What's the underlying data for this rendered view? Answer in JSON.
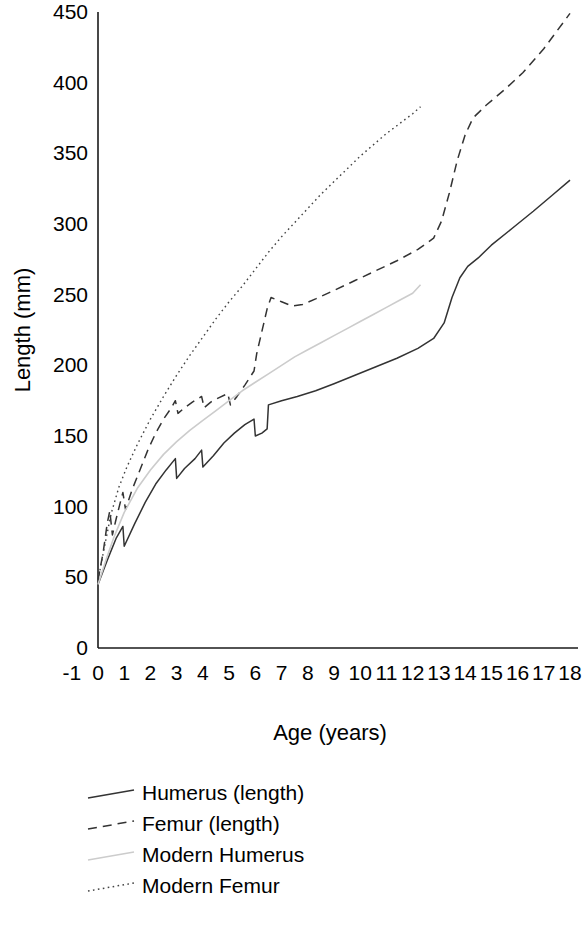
{
  "chart_data": {
    "type": "line",
    "title": "",
    "xlabel": "Age (years)",
    "ylabel": "Length (mm)",
    "xlim": [
      -1,
      18
    ],
    "ylim": [
      0,
      450
    ],
    "xticks": [
      "-1",
      "0",
      "1",
      "2",
      "3",
      "4",
      "5",
      "6",
      "7",
      "8",
      "9",
      "10",
      "11",
      "12",
      "13",
      "14",
      "15",
      "16",
      "17",
      "18"
    ],
    "yticks": [
      "0",
      "50",
      "100",
      "150",
      "200",
      "250",
      "300",
      "350",
      "400",
      "450"
    ],
    "grid": false,
    "legend_position": "below-plot-left",
    "series": [
      {
        "name": "Humerus (length)",
        "style": "solid",
        "color": "#333333",
        "width": 1.5,
        "points": [
          [
            0.0,
            45
          ],
          [
            0.35,
            62
          ],
          [
            0.7,
            78
          ],
          [
            0.95,
            86
          ],
          [
            1.0,
            72
          ],
          [
            1.4,
            88
          ],
          [
            1.8,
            103
          ],
          [
            2.2,
            116
          ],
          [
            2.6,
            126
          ],
          [
            2.95,
            134
          ],
          [
            3.0,
            120
          ],
          [
            3.3,
            127
          ],
          [
            3.7,
            134
          ],
          [
            3.95,
            140
          ],
          [
            4.0,
            128
          ],
          [
            4.4,
            136
          ],
          [
            4.8,
            145
          ],
          [
            5.2,
            152
          ],
          [
            5.6,
            158
          ],
          [
            5.95,
            162
          ],
          [
            6.0,
            150
          ],
          [
            6.25,
            152
          ],
          [
            6.45,
            155
          ],
          [
            6.5,
            172
          ],
          [
            7.0,
            175
          ],
          [
            7.6,
            178
          ],
          [
            8.3,
            182
          ],
          [
            9.0,
            187
          ],
          [
            9.8,
            193
          ],
          [
            10.6,
            199
          ],
          [
            11.4,
            205
          ],
          [
            12.2,
            212
          ],
          [
            12.8,
            219
          ],
          [
            13.2,
            230
          ],
          [
            13.5,
            248
          ],
          [
            13.8,
            262
          ],
          [
            14.1,
            270
          ],
          [
            14.5,
            276
          ],
          [
            15.0,
            285
          ],
          [
            15.8,
            297
          ],
          [
            16.6,
            309
          ],
          [
            17.3,
            320
          ],
          [
            18.0,
            331
          ]
        ]
      },
      {
        "name": "Femur (length)",
        "style": "dashed",
        "color": "#333333",
        "width": 1.5,
        "points": [
          [
            0.0,
            48
          ],
          [
            0.2,
            68
          ],
          [
            0.35,
            88
          ],
          [
            0.45,
            97
          ],
          [
            0.55,
            80
          ],
          [
            0.7,
            92
          ],
          [
            0.85,
            103
          ],
          [
            0.95,
            110
          ],
          [
            1.05,
            98
          ],
          [
            1.3,
            112
          ],
          [
            1.6,
            126
          ],
          [
            1.9,
            140
          ],
          [
            2.2,
            152
          ],
          [
            2.5,
            162
          ],
          [
            2.8,
            170
          ],
          [
            2.95,
            175
          ],
          [
            3.05,
            166
          ],
          [
            3.3,
            170
          ],
          [
            3.6,
            174
          ],
          [
            3.95,
            178
          ],
          [
            4.05,
            170
          ],
          [
            4.3,
            174
          ],
          [
            4.6,
            177
          ],
          [
            4.95,
            180
          ],
          [
            5.05,
            172
          ],
          [
            5.3,
            178
          ],
          [
            5.6,
            186
          ],
          [
            5.95,
            196
          ],
          [
            6.05,
            208
          ],
          [
            6.25,
            224
          ],
          [
            6.45,
            240
          ],
          [
            6.6,
            248
          ],
          [
            7.0,
            245
          ],
          [
            7.4,
            242
          ],
          [
            7.8,
            243
          ],
          [
            8.3,
            247
          ],
          [
            9.0,
            253
          ],
          [
            9.8,
            260
          ],
          [
            10.6,
            267
          ],
          [
            11.4,
            274
          ],
          [
            12.2,
            282
          ],
          [
            12.8,
            290
          ],
          [
            13.1,
            302
          ],
          [
            13.4,
            322
          ],
          [
            13.7,
            345
          ],
          [
            14.0,
            363
          ],
          [
            14.3,
            375
          ],
          [
            14.8,
            384
          ],
          [
            15.5,
            395
          ],
          [
            16.2,
            407
          ],
          [
            17.0,
            424
          ],
          [
            18.0,
            449
          ]
        ]
      },
      {
        "name": "Modern Humerus",
        "style": "solid",
        "color": "#cccccc",
        "width": 1.6,
        "points": [
          [
            0.0,
            45
          ],
          [
            0.3,
            62
          ],
          [
            0.6,
            78
          ],
          [
            1.0,
            96
          ],
          [
            1.5,
            113
          ],
          [
            2.0,
            126
          ],
          [
            2.5,
            137
          ],
          [
            3.0,
            146
          ],
          [
            3.5,
            154
          ],
          [
            4.0,
            161
          ],
          [
            4.5,
            168
          ],
          [
            5.0,
            175
          ],
          [
            5.5,
            182
          ],
          [
            6.0,
            188
          ],
          [
            6.5,
            194
          ],
          [
            7.0,
            200
          ],
          [
            7.5,
            206
          ],
          [
            8.0,
            211
          ],
          [
            8.5,
            216
          ],
          [
            9.0,
            221
          ],
          [
            9.5,
            226
          ],
          [
            10.0,
            231
          ],
          [
            10.5,
            236
          ],
          [
            11.0,
            241
          ],
          [
            11.5,
            246
          ],
          [
            12.0,
            251
          ],
          [
            12.3,
            257
          ]
        ]
      },
      {
        "name": "Modern Femur",
        "style": "dotted",
        "color": "#444444",
        "width": 1.4,
        "points": [
          [
            0.0,
            48
          ],
          [
            0.25,
            72
          ],
          [
            0.5,
            95
          ],
          [
            0.8,
            114
          ],
          [
            1.1,
            128
          ],
          [
            1.5,
            144
          ],
          [
            2.0,
            162
          ],
          [
            2.5,
            178
          ],
          [
            3.0,
            193
          ],
          [
            3.5,
            207
          ],
          [
            4.0,
            220
          ],
          [
            4.5,
            233
          ],
          [
            5.0,
            245
          ],
          [
            5.5,
            256
          ],
          [
            6.0,
            268
          ],
          [
            6.5,
            280
          ],
          [
            7.0,
            291
          ],
          [
            7.5,
            301
          ],
          [
            8.0,
            311
          ],
          [
            8.5,
            321
          ],
          [
            9.0,
            330
          ],
          [
            9.5,
            339
          ],
          [
            10.0,
            348
          ],
          [
            10.5,
            356
          ],
          [
            11.0,
            364
          ],
          [
            11.5,
            371
          ],
          [
            12.0,
            378
          ],
          [
            12.3,
            383
          ]
        ]
      }
    ]
  },
  "legend": {
    "items": [
      {
        "label": "Humerus (length)",
        "style": "solid",
        "color": "#333333"
      },
      {
        "label": "Femur (length)",
        "style": "dashed",
        "color": "#333333"
      },
      {
        "label": "Modern Humerus",
        "style": "solid",
        "color": "#cccccc"
      },
      {
        "label": "Modern Femur",
        "style": "dotted",
        "color": "#444444"
      }
    ]
  }
}
